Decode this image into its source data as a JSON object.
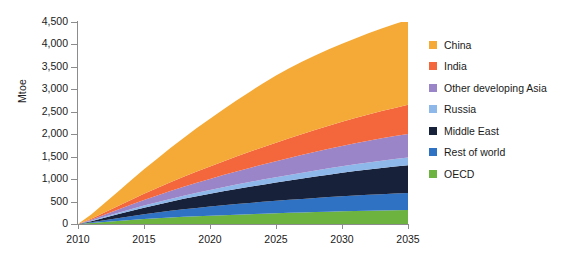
{
  "chart_data": {
    "type": "area",
    "stacked": true,
    "title": "",
    "xlabel": "",
    "ylabel": "Mtoe",
    "x": [
      2010,
      2011,
      2012,
      2013,
      2014,
      2015,
      2016,
      2017,
      2018,
      2019,
      2020,
      2021,
      2022,
      2023,
      2024,
      2025,
      2026,
      2027,
      2028,
      2029,
      2030,
      2031,
      2032,
      2033,
      2034,
      2035
    ],
    "xlim": [
      2010,
      2035
    ],
    "ylim": [
      0,
      4500
    ],
    "xticks": [
      2010,
      2015,
      2020,
      2025,
      2030,
      2035
    ],
    "xtick_labels": [
      "2010",
      "2015",
      "2020",
      "2025",
      "2030",
      "2035"
    ],
    "yticks": [
      0,
      500,
      1000,
      1500,
      2000,
      2500,
      3000,
      3500,
      4000,
      4500
    ],
    "ytick_labels": [
      "0",
      "500",
      "1,000",
      "1,500",
      "2,000",
      "2,500",
      "3,000",
      "3,500",
      "4,000",
      "4,500"
    ],
    "grid": false,
    "legend_position": "right",
    "stack_order_bottom_to_top": [
      "OECD",
      "Rest of world",
      "Middle East",
      "Russia",
      "Other developing Asia",
      "India",
      "China"
    ],
    "series": [
      {
        "name": "OECD",
        "color": "#6cb33f",
        "values": [
          0,
          20,
          45,
          68,
          90,
          110,
          128,
          145,
          160,
          173,
          185,
          197,
          208,
          219,
          229,
          238,
          248,
          257,
          266,
          274,
          282,
          289,
          295,
          300,
          305,
          310
        ]
      },
      {
        "name": "Rest of world",
        "color": "#2f72c4",
        "values": [
          0,
          18,
          40,
          62,
          85,
          108,
          128,
          148,
          168,
          186,
          204,
          220,
          236,
          250,
          264,
          278,
          290,
          302,
          314,
          325,
          336,
          346,
          356,
          365,
          373,
          380
        ]
      },
      {
        "name": "Middle East",
        "color": "#17213a",
        "values": [
          0,
          26,
          56,
          86,
          116,
          146,
          175,
          204,
          232,
          258,
          284,
          310,
          335,
          360,
          384,
          408,
          432,
          455,
          478,
          500,
          522,
          543,
          563,
          583,
          601,
          620
        ]
      },
      {
        "name": "Russia",
        "color": "#8fb8ea",
        "values": [
          0,
          9,
          19,
          28,
          37,
          46,
          54,
          62,
          70,
          78,
          85,
          92,
          99,
          106,
          112,
          118,
          124,
          130,
          136,
          142,
          148,
          153,
          158,
          163,
          167,
          170
        ]
      },
      {
        "name": "Other developing Asia",
        "color": "#9b85c9",
        "values": [
          0,
          22,
          48,
          74,
          100,
          126,
          151,
          176,
          200,
          224,
          247,
          270,
          292,
          314,
          335,
          356,
          376,
          396,
          415,
          434,
          452,
          469,
          485,
          500,
          513,
          525
        ]
      },
      {
        "name": "India",
        "color": "#f4663c",
        "values": [
          0,
          23,
          50,
          78,
          107,
          136,
          165,
          194,
          222,
          250,
          278,
          306,
          333,
          360,
          387,
          413,
          439,
          464,
          489,
          513,
          537,
          560,
          583,
          605,
          626,
          650
        ]
      },
      {
        "name": "China",
        "color": "#f5a936",
        "values": [
          0,
          95,
          205,
          318,
          432,
          545,
          655,
          762,
          866,
          967,
          1064,
          1158,
          1248,
          1334,
          1417,
          1496,
          1560,
          1615,
          1662,
          1703,
          1740,
          1775,
          1808,
          1840,
          1870,
          1895
        ]
      }
    ],
    "totals_2035": 4550,
    "units": "Mtoe"
  },
  "legend": {
    "items": [
      {
        "label": "China",
        "color": "#f5a936"
      },
      {
        "label": "India",
        "color": "#f4663c"
      },
      {
        "label": "Other developing Asia",
        "color": "#9b85c9"
      },
      {
        "label": "Russia",
        "color": "#8fb8ea"
      },
      {
        "label": "Middle East",
        "color": "#17213a"
      },
      {
        "label": "Rest of world",
        "color": "#2f72c4"
      },
      {
        "label": "OECD",
        "color": "#6cb33f"
      }
    ]
  },
  "axes": {
    "y_title": "Mtoe",
    "axis_color": "#8c8c8c",
    "text_color": "#1a1a1a"
  }
}
